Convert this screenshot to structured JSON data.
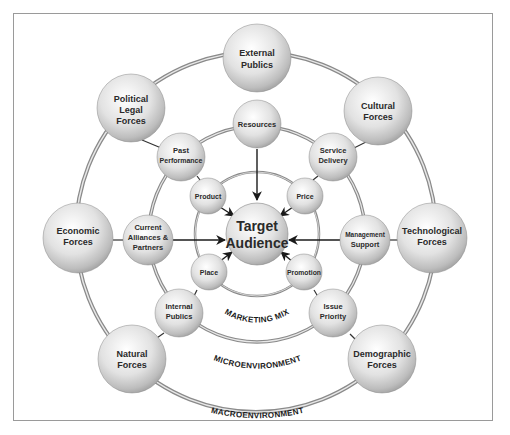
{
  "diagram": {
    "center": {
      "label": [
        "Target",
        "Audience"
      ]
    },
    "rings": {
      "marketing_mix": "MARKETING MIX",
      "microenvironment": "MICROENVIRONMENT",
      "macroenvironment": "MACROENVIRONMENT"
    },
    "marketing_mix_nodes": [
      {
        "id": "product",
        "label": [
          "Product"
        ]
      },
      {
        "id": "price",
        "label": [
          "Price"
        ]
      },
      {
        "id": "place",
        "label": [
          "Place"
        ]
      },
      {
        "id": "promotion",
        "label": [
          "Promotion"
        ]
      }
    ],
    "microenvironment_nodes": [
      {
        "id": "resources",
        "label": [
          "Resources"
        ]
      },
      {
        "id": "past-performance",
        "label": [
          "Past",
          "Performance"
        ]
      },
      {
        "id": "service-delivery",
        "label": [
          "Service",
          "Delivery"
        ]
      },
      {
        "id": "current-alliances",
        "label": [
          "Current",
          "Alliances &",
          "Partners"
        ]
      },
      {
        "id": "management-support",
        "label": [
          "Management",
          "Support"
        ]
      },
      {
        "id": "internal-publics",
        "label": [
          "Internal",
          "Publics"
        ]
      },
      {
        "id": "issue-priority",
        "label": [
          "Issue",
          "Priority"
        ]
      }
    ],
    "macroenvironment_nodes": [
      {
        "id": "external-publics",
        "label": [
          "External",
          "Publics"
        ]
      },
      {
        "id": "political-legal-forces",
        "label": [
          "Political",
          "Legal",
          "Forces"
        ]
      },
      {
        "id": "cultural-forces",
        "label": [
          "Cultural",
          "Forces"
        ]
      },
      {
        "id": "economic-forces",
        "label": [
          "Economic",
          "Forces"
        ]
      },
      {
        "id": "technological-forces",
        "label": [
          "Technological",
          "Forces"
        ]
      },
      {
        "id": "natural-forces",
        "label": [
          "Natural",
          "Forces"
        ]
      },
      {
        "id": "demographic-forces",
        "label": [
          "Demographic",
          "Forces"
        ]
      }
    ]
  }
}
